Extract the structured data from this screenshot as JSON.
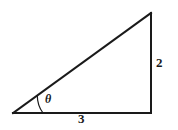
{
  "figure": {
    "name": "right-triangle-diagram",
    "background_color": "#ffffff",
    "stroke_color": "#1a1a1a",
    "stroke_width": 2,
    "arc_stroke_width": 1.2,
    "geometry": {
      "left_vertex": {
        "x": 13,
        "y": 113
      },
      "right_vertex": {
        "x": 151,
        "y": 113
      },
      "apex_vertex": {
        "x": 151,
        "y": 13
      },
      "angle_arc_radius": 30
    },
    "labels": {
      "base": "3",
      "vertical": "2",
      "angle": "θ"
    },
    "paths": {
      "base_line": "M 13 113 L 151 113",
      "vertical_line": "M 151 113 L 151 13",
      "hypotenuse_line": "M 13 113 L 151 13",
      "angle_arc": "M 43 113 A 30 30 0 0 0 40.1 99.8"
    }
  }
}
